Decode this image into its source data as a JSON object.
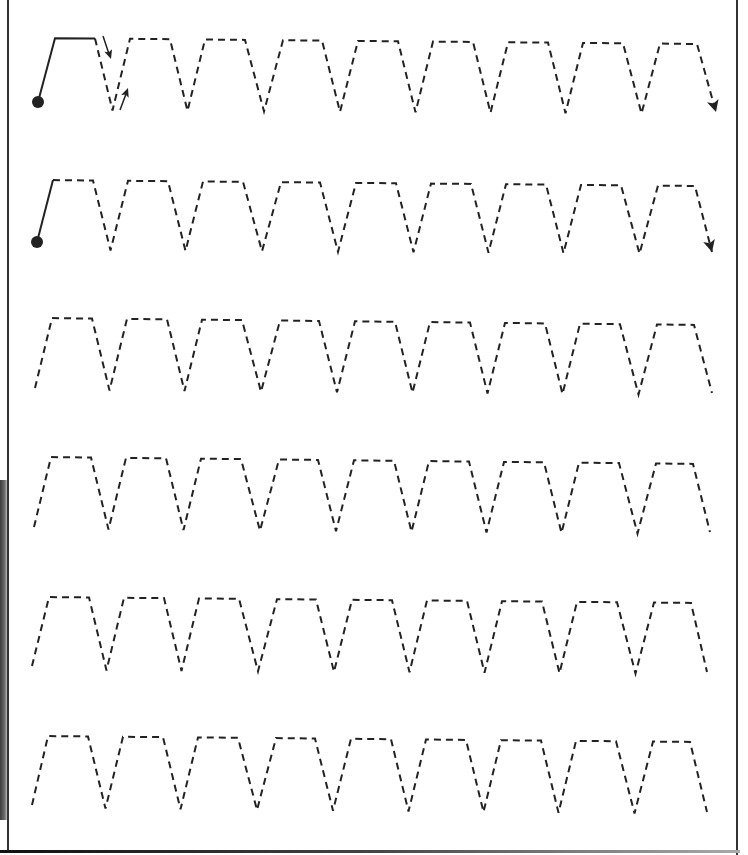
{
  "worksheet": {
    "type": "pre-writing tracing practice",
    "pattern": "trapezoid zigzag (dashed)",
    "rows_count": 6,
    "peaks_per_row": 9,
    "colors": {
      "stroke": "#222222",
      "background": "#ffffff",
      "border": "#333333"
    },
    "rows": [
      {
        "index": 1,
        "start_dot": true,
        "solid_demo_segment": true,
        "direction_arrows": true,
        "end_arrow": true
      },
      {
        "index": 2,
        "start_dot": true,
        "solid_demo_segment": true,
        "direction_arrows": false,
        "end_arrow": true
      },
      {
        "index": 3,
        "start_dot": false,
        "solid_demo_segment": false,
        "direction_arrows": false,
        "end_arrow": false
      },
      {
        "index": 4,
        "start_dot": false,
        "solid_demo_segment": false,
        "direction_arrows": false,
        "end_arrow": false
      },
      {
        "index": 5,
        "start_dot": false,
        "solid_demo_segment": false,
        "direction_arrows": false,
        "end_arrow": false
      },
      {
        "index": 6,
        "start_dot": false,
        "solid_demo_segment": false,
        "direction_arrows": false,
        "end_arrow": false
      }
    ]
  }
}
